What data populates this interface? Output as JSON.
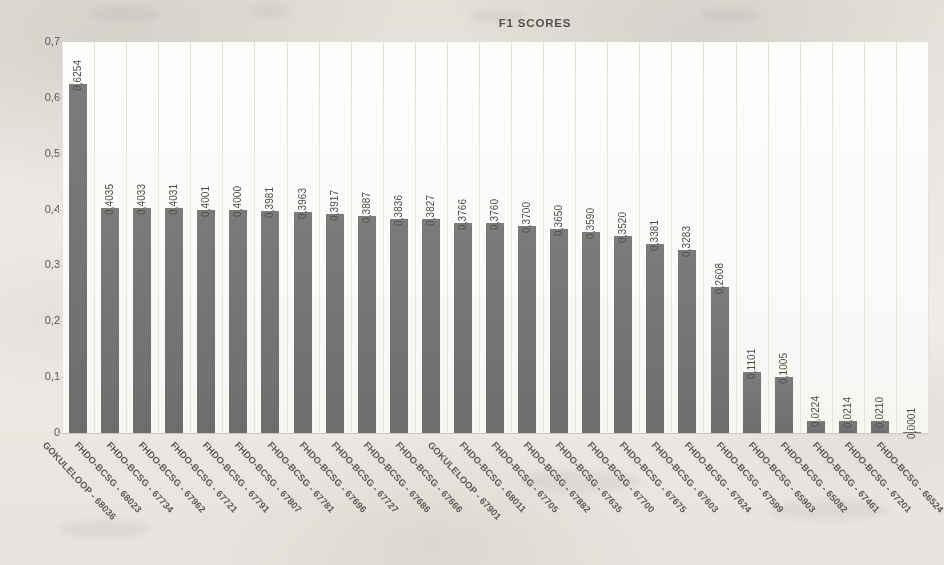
{
  "chart_data": {
    "type": "bar",
    "title": "F1 SCORES",
    "xlabel": "",
    "ylabel": "",
    "ylim": [
      0,
      0.7
    ],
    "ytick_labels": [
      "0,7",
      "0,6",
      "0,5",
      "0,4",
      "0,3",
      "0,2",
      "0,1",
      "0"
    ],
    "ytick_values": [
      0.7,
      0.6,
      0.5,
      0.4,
      0.3,
      0.2,
      0.1,
      0
    ],
    "grid": "vertical-only",
    "legend": "none",
    "bar_color": "#767472",
    "decimal_separator": ",",
    "categories": [
      "GOKULELOOP - 68036",
      "FHDO-BCSG - 68023",
      "FHDO-BCSG - 67734",
      "FHDO-BCSG - 67962",
      "FHDO-BCSG - 67721",
      "FHDO-BCSG - 67791",
      "FHDO-BCSG - 67807",
      "FHDO-BCSG - 67781",
      "FHDO-BCSG - 67696",
      "FHDO-BCSG - 67727",
      "FHDO-BCSG - 67686",
      "FHDO-BCSG - 67666",
      "GOKULELOOP - 67901",
      "FHDO-BCSG - 68011",
      "FHDO-BCSG - 67705",
      "FHDO-BCSG - 67882",
      "FHDO-BCSG - 67635",
      "FHDO-BCSG - 67700",
      "FHDO-BCSG - 67675",
      "FHDO-BCSG - 67603",
      "FHDO-BCSG - 67624",
      "FHDO-BCSG - 67599",
      "FHDO-BCSG - 65903",
      "FHDO-BCSG - 65082",
      "FHDO-BCSG - 67461",
      "FHDO-BCSG - 67201",
      "FHDO-BCSG - 66524"
    ],
    "values": [
      0.6254,
      0.4035,
      0.4033,
      0.4031,
      0.4001,
      0.4,
      0.3981,
      0.3963,
      0.3917,
      0.3887,
      0.3836,
      0.3827,
      0.3766,
      0.376,
      0.37,
      0.365,
      0.359,
      0.352,
      0.3381,
      0.3283,
      0.2608,
      0.1101,
      0.1005,
      0.0224,
      0.0214,
      0.021,
      0.0001
    ],
    "value_labels": [
      "0,6254",
      "0,4035",
      "0,4033",
      "0,4031",
      "0,4001",
      "0,4000",
      "0,3981",
      "0,3963",
      "0,3917",
      "0,3887",
      "0,3836",
      "0,3827",
      "0,3766",
      "0,3760",
      "0,3700",
      "0,3650",
      "0,3590",
      "0,3520",
      "0,3381",
      "0,3283",
      "0,2608",
      "0,1101",
      "0,1005",
      "0,0224",
      "0,0214",
      "0,0210",
      "0,0001"
    ]
  }
}
